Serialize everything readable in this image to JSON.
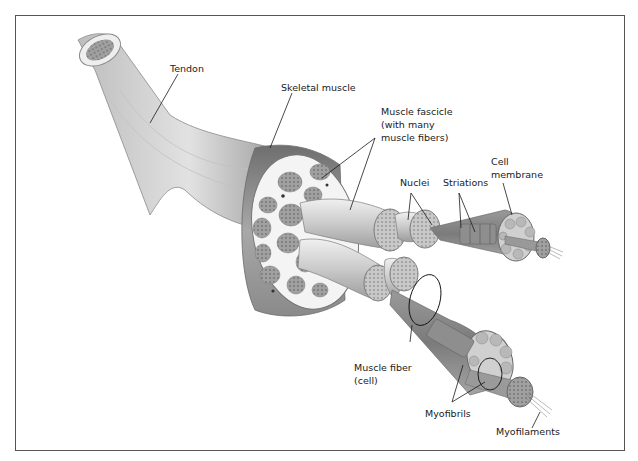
{
  "figure": {
    "labels": {
      "tendon": "Tendon",
      "skeletal_muscle": "Skeletal muscle",
      "fascicle_line1": "Muscle fascicle",
      "fascicle_line2": "(with many",
      "fascicle_line3": "muscle fibers)",
      "nuclei": "Nuclei",
      "striations": "Striations",
      "cell_membrane_line1": "Cell",
      "cell_membrane_line2": "membrane",
      "muscle_fiber_line1": "Muscle fiber",
      "muscle_fiber_line2": "(cell)",
      "myofibrils": "Myofibrils",
      "myofilaments": "Myofilaments"
    },
    "colors": {
      "frame": "#555555",
      "muscle_dark": "#7a7a7a",
      "muscle_mid": "#a6a6a6",
      "tendon_light": "#d4d4d4",
      "cross_section_bg": "#f2f2f2",
      "fascicle_fill": "#9a9a9a",
      "leader_line": "#1a1a1a"
    },
    "caption": ""
  }
}
